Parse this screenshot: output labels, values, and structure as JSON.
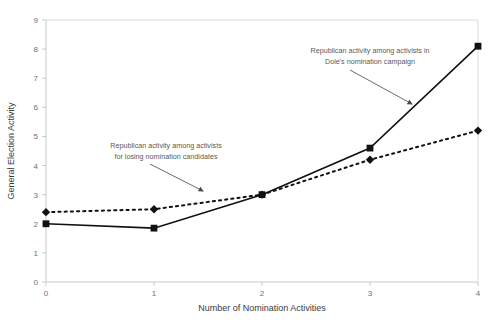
{
  "chart_data": {
    "type": "line",
    "title": "",
    "xlabel": "Number of Nomination Activities",
    "ylabel": "General Election Activity",
    "x": [
      0,
      1,
      2,
      3,
      4
    ],
    "xticklabels": [
      "0",
      "1",
      "2",
      "3",
      "4"
    ],
    "yticklabels": [
      "0",
      "1",
      "2",
      "3",
      "4",
      "5",
      "6",
      "7",
      "8",
      "9"
    ],
    "xlim": [
      0,
      4
    ],
    "ylim": [
      0,
      9
    ],
    "grid": false,
    "legend": "none",
    "series": [
      {
        "name": "Republican activity among activists in Dole's nomination campaign",
        "values": [
          2.0,
          1.85,
          3.0,
          4.6,
          8.1
        ],
        "linestyle": "solid",
        "marker": "square",
        "color": "#111111"
      },
      {
        "name": "Republican activity among activists for losing nomination candidates",
        "values": [
          2.4,
          2.5,
          3.0,
          4.2,
          5.2
        ],
        "linestyle": "dotted",
        "marker": "diamond",
        "color": "#111111"
      }
    ],
    "annotations": [
      {
        "id": "annotation-losing-candidates",
        "line1": "Republican activity among activists",
        "line2": "for losing nomination candidates",
        "text_x": 166,
        "text_y1": 148,
        "text_y2": 159,
        "arrow_from_x": 150,
        "arrow_from_y": 164,
        "arrow_to_x": 203,
        "arrow_to_y": 191
      },
      {
        "id": "annotation-dole-campaign",
        "line1": "Republican activity among activists in",
        "line2": "Dole's nomination campaign",
        "text_x": 370,
        "text_y1": 53,
        "text_y2": 64,
        "arrow_from_x": 350,
        "arrow_from_y": 70,
        "arrow_to_x": 412,
        "arrow_to_y": 104
      }
    ]
  },
  "colors": {
    "series": "#111111",
    "axis": "#c9c9c9",
    "tick_text": "#6f6f6f",
    "axis_title": "#3a3a3a",
    "annotation_text": "#5a5a5a",
    "background": "#ffffff"
  }
}
